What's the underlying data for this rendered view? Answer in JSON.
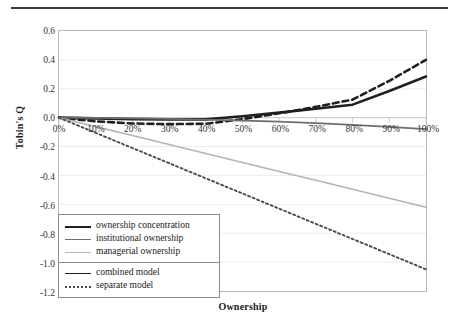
{
  "figure": {
    "x_axis_title": "Ownership",
    "y_axis_title": "Tobin's Q"
  },
  "legend": {
    "groups": [
      {
        "items": [
          {
            "label": "ownership concentration",
            "color": "#1f1f1f",
            "width": 2.6,
            "dash": "solid"
          },
          {
            "label": "institutional ownership",
            "color": "#6e6e6e",
            "width": 1.8,
            "dash": "solid"
          },
          {
            "label": "managerial ownership",
            "color": "#b4b4b4",
            "width": 1.6,
            "dash": "solid"
          }
        ]
      },
      {
        "items": [
          {
            "label": "combined model",
            "color": "#1f1f1f",
            "width": 1.8,
            "dash": "solid"
          },
          {
            "label": "separate model",
            "color": "#4a4a4a",
            "width": 1.8,
            "dash": "dotted"
          }
        ]
      }
    ]
  },
  "chart_data": {
    "type": "line",
    "title": "",
    "xlabel": "Ownership",
    "ylabel": "Tobin's Q",
    "xlim": [
      0,
      100
    ],
    "ylim": [
      -1.2,
      0.6
    ],
    "grid": true,
    "legend_position": "inside-lower-left",
    "x_tick_labels": [
      "0%",
      "10%",
      "20%",
      "30%",
      "40%",
      "50%",
      "60%",
      "70%",
      "80%",
      "90%",
      "100%"
    ],
    "x_tick_values": [
      0,
      10,
      20,
      30,
      40,
      50,
      60,
      70,
      80,
      90,
      100
    ],
    "y_tick_labels": [
      "0.6",
      "0.4",
      "0.2",
      "0.0",
      "-0.2",
      "-0.4",
      "-0.6",
      "-0.8",
      "-1.0",
      "-1.2"
    ],
    "y_tick_values": [
      0.6,
      0.4,
      0.2,
      0.0,
      -0.2,
      -0.4,
      -0.6,
      -0.8,
      -1.0,
      -1.2
    ],
    "x": [
      0,
      10,
      20,
      30,
      40,
      50,
      60,
      70,
      80,
      90,
      100
    ],
    "series": [
      {
        "name": "ownership concentration - combined model",
        "variable": "ownership concentration",
        "model": "combined model",
        "color": "#1f1f1f",
        "width": 2.6,
        "dash": "solid",
        "values": [
          0.0,
          -0.005,
          -0.01,
          -0.012,
          -0.012,
          0.01,
          0.035,
          0.062,
          0.09,
          0.185,
          0.285
        ]
      },
      {
        "name": "ownership concentration - separate model",
        "variable": "ownership concentration",
        "model": "separate model",
        "color": "#1f1f1f",
        "width": 2.6,
        "dash": "dashed",
        "values": [
          0.0,
          -0.025,
          -0.04,
          -0.045,
          -0.042,
          -0.01,
          0.03,
          0.075,
          0.125,
          0.255,
          0.4
        ]
      },
      {
        "name": "institutional ownership - combined model",
        "variable": "institutional ownership",
        "model": "combined model",
        "color": "#6e6e6e",
        "width": 1.8,
        "dash": "solid",
        "values": [
          0.0,
          -0.002,
          -0.005,
          -0.009,
          -0.014,
          -0.02,
          -0.028,
          -0.038,
          -0.05,
          -0.064,
          -0.08
        ]
      },
      {
        "name": "managerial ownership - combined model",
        "variable": "managerial ownership",
        "model": "combined model",
        "color": "#b4b4b4",
        "width": 1.6,
        "dash": "solid",
        "values": [
          0.0,
          -0.062,
          -0.124,
          -0.186,
          -0.248,
          -0.31,
          -0.372,
          -0.434,
          -0.496,
          -0.558,
          -0.62
        ]
      },
      {
        "name": "managerial ownership - separate model",
        "variable": "managerial ownership",
        "model": "separate model",
        "color": "#4a4a4a",
        "width": 1.9,
        "dash": "dotted",
        "values": [
          0.0,
          -0.105,
          -0.21,
          -0.315,
          -0.42,
          -0.525,
          -0.63,
          -0.735,
          -0.84,
          -0.945,
          -1.05
        ]
      }
    ]
  }
}
